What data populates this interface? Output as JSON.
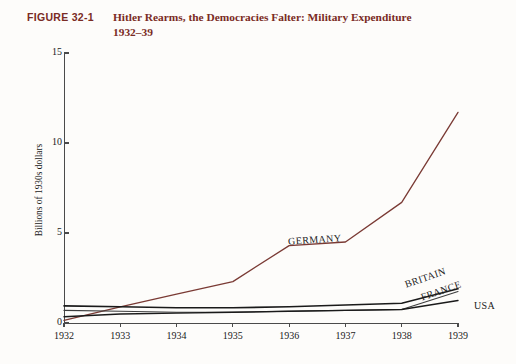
{
  "figure": {
    "label": "FIGURE 32-1",
    "title_line1": "Hitler Rearms, the Democracies Falter: Military Expenditure",
    "title_line2": "1932–39",
    "label_color": "#7a2b24"
  },
  "chart_data": {
    "type": "line",
    "title": "Hitler Rearms, the Democracies Falter: Military Expenditure 1932–39",
    "xlabel": "",
    "ylabel": "Billions of 1930s dollars",
    "x": [
      1932,
      1933,
      1934,
      1935,
      1936,
      1937,
      1938,
      1939
    ],
    "xtick_labels": [
      "1932",
      "1933",
      "1934",
      "1935",
      "1936",
      "1937",
      "1938",
      "1939"
    ],
    "ytick_labels": [
      "0",
      "5",
      "10",
      "15"
    ],
    "ytick_values": [
      0,
      5,
      10,
      15
    ],
    "xlim": [
      1932,
      1939
    ],
    "ylim": [
      0,
      15
    ],
    "grid": false,
    "legend": "inline-labels",
    "series": [
      {
        "name": "GERMANY",
        "color": "#7a3a34",
        "width": 1.3,
        "values": [
          0.15,
          0.9,
          1.6,
          2.3,
          4.3,
          4.5,
          6.7,
          11.7
        ]
      },
      {
        "name": "BRITAIN",
        "color": "#1a1a1a",
        "width": 1.6,
        "values": [
          0.95,
          0.9,
          0.85,
          0.85,
          0.9,
          1.0,
          1.1,
          1.9
        ]
      },
      {
        "name": "FRANCE",
        "color": "#3d3d3d",
        "width": 1.1,
        "values": [
          0.7,
          0.65,
          0.6,
          0.6,
          0.65,
          0.7,
          0.75,
          1.75
        ]
      },
      {
        "name": "USA",
        "color": "#1a1a1a",
        "width": 1.4,
        "values": [
          0.35,
          0.5,
          0.55,
          0.6,
          0.65,
          0.7,
          0.75,
          1.25
        ]
      }
    ]
  }
}
